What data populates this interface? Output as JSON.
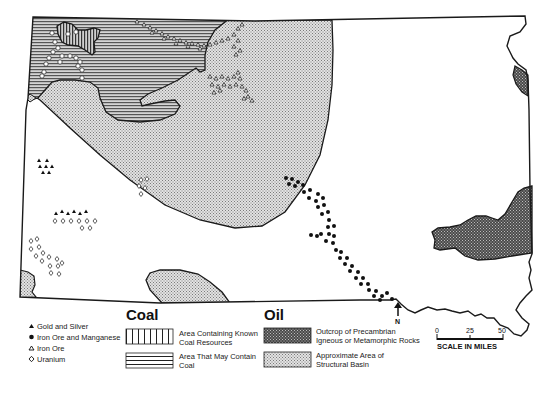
{
  "map": {
    "region": "State resource map (outline)",
    "colors": {
      "outline": "#1a1a1a",
      "basin_fill": "#cfcfcf",
      "precambrian_fill": "#5a5a5a",
      "background": "#ffffff"
    },
    "north_arrow": {
      "label": "N"
    },
    "scale": {
      "title": "SCALE IN MILES",
      "ticks": [
        "0",
        "25",
        "50"
      ]
    }
  },
  "legend": {
    "minerals": [
      {
        "symbol": "filled-triangle",
        "glyph": "▲",
        "label": "Gold and Silver"
      },
      {
        "symbol": "filled-circle",
        "glyph": "●",
        "label": "Iron Ore and Manganese"
      },
      {
        "symbol": "open-triangle",
        "glyph": "△",
        "label": "Iron Ore"
      },
      {
        "symbol": "open-diamond",
        "glyph": "◇",
        "label": "Uranium"
      }
    ],
    "coal": {
      "heading": "Coal",
      "items": [
        {
          "pattern": "vertical-lines",
          "label_line1": "Area Containing Known",
          "label_line2": "Coal Resources"
        },
        {
          "pattern": "horizontal-lines",
          "label_line1": "Area That May Contain",
          "label_line2": "Coal"
        }
      ]
    },
    "oil": {
      "heading": "Oil",
      "items": [
        {
          "pattern": "dark-stipple",
          "label_line1": "Outcrop of Precambrian",
          "label_line2": "Igneous or Metamorphic Rocks"
        },
        {
          "pattern": "light-stipple",
          "label_line1": "Approximate Area of",
          "label_line2": "Structural Basin"
        }
      ]
    }
  }
}
